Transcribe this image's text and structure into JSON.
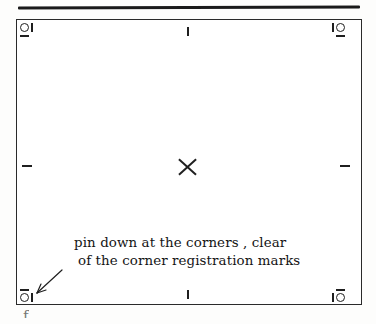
{
  "page": {
    "background_color": "#fdfdfc",
    "ink_color": "#1f1f1f"
  },
  "top_rule": {
    "name": "top-rule"
  },
  "frame": {
    "name": "sheet-frame",
    "border_color": "#2a2a2a",
    "fill_color": "#ffffff"
  },
  "registration_marks": [
    {
      "position": "top-left",
      "glyph": "circle-bar-dash"
    },
    {
      "position": "top-right",
      "glyph": "bar-circle-dash"
    },
    {
      "position": "bottom-left",
      "glyph": "dash-circle-bar"
    },
    {
      "position": "bottom-right",
      "glyph": "dash-bar-circle"
    }
  ],
  "edge_ticks": [
    {
      "position": "top-center",
      "orientation": "vertical"
    },
    {
      "position": "bottom-center",
      "orientation": "vertical"
    },
    {
      "position": "left-center",
      "orientation": "horizontal"
    },
    {
      "position": "right-center",
      "orientation": "horizontal"
    }
  ],
  "center_mark": {
    "glyph": "x-cross"
  },
  "caption": {
    "line1": "pin down at the corners , clear",
    "line2": "of the corner registration marks"
  },
  "arrow": {
    "points_to": "bottom-left-corner",
    "direction": "down-left"
  },
  "stray_glyph": {
    "text": "f"
  }
}
